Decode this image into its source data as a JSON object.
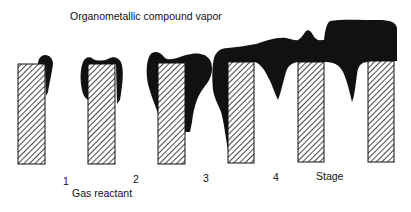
{
  "diagram": {
    "title": "Organometallic compound vapor",
    "stages": [
      {
        "number": "1"
      },
      {
        "number": "2"
      },
      {
        "number": "3"
      },
      {
        "number": "4"
      }
    ],
    "stage_label": "Stage",
    "bottom_label": "Gas reactant",
    "colors": {
      "ink": "#111111",
      "background": "#ffffff",
      "hatch": "#1a1a1a"
    }
  }
}
